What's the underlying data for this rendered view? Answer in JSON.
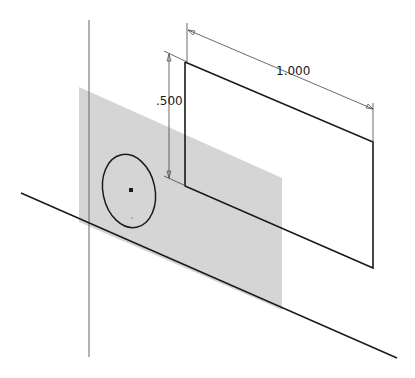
{
  "diagram": {
    "type": "cad-sketch-isometric",
    "colors": {
      "background": "#ffffff",
      "plane_fill": "#d3d3d3",
      "sketch_line": "#1a1a1a",
      "construction_line": "#555555",
      "dimension_line": "#444444"
    },
    "dimensions": [
      {
        "id": "width",
        "label": "1.000",
        "x": 276,
        "y": 65
      },
      {
        "id": "height",
        "label": ".500",
        "x": 155,
        "y": 95
      }
    ],
    "sketch": {
      "rectangle": {
        "label": "sketch-rectangle"
      },
      "ellipse": {
        "label": "sketch-circle",
        "center_point": "sketch-point"
      }
    },
    "work_plane": {
      "label": "work-plane"
    },
    "axes": [
      {
        "label": "vertical-axis"
      },
      {
        "label": "horizontal-axis"
      }
    ]
  }
}
